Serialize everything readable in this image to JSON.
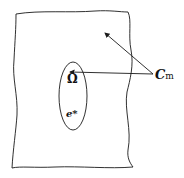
{
  "diagram": {
    "labels": {
      "omega": "Ω",
      "element": "e*",
      "cm_main": "C",
      "cm_sub": "m"
    },
    "colors": {
      "stroke": "#1a1a1a",
      "background": "#ffffff"
    },
    "shapes": {
      "outer_region": "irregular closed boundary",
      "inner_region": "ellipse",
      "arrows": 2
    }
  }
}
